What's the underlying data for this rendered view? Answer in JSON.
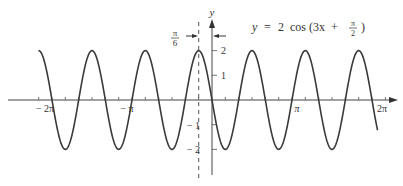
{
  "chart_data": {
    "type": "line",
    "equation": {
      "lhs": "y",
      "eq": "=",
      "rhs_prefix": "2  cos (3x  +",
      "frac_num": "π",
      "frac_den": "2",
      "rhs_suffix": ")"
    },
    "xlabel": "",
    "ylabel": "y",
    "x_tick_labels": [
      "− 2π",
      "− π",
      "π",
      "2π"
    ],
    "x_tick_values": [
      -6.2832,
      -3.1416,
      3.1416,
      6.2832
    ],
    "y_tick_labels": [
      "2",
      "1",
      "− 1",
      "− 2"
    ],
    "y_tick_values": [
      2,
      1,
      -1,
      -2
    ],
    "xlim": [
      -2.17,
      2.07
    ],
    "xlim_units": "multiples of π",
    "ylim": [
      -2,
      2
    ],
    "amplitude": 2,
    "period": "2π/3",
    "phase_shift": "−π/6",
    "annotation": {
      "label_num": "π",
      "label_den": "6",
      "description": "dashed vertical line at x = −π/6 marking the phase shift (peak location)"
    },
    "series": [
      {
        "name": "y = 2 cos(3x + π/2)",
        "x": [
          -6.807,
          -6.283,
          -5.76,
          -5.236,
          -4.712,
          -4.189,
          -3.665,
          -3.142,
          -2.618,
          -2.094,
          -1.571,
          -1.047,
          -0.524,
          0,
          0.524,
          1.047,
          1.571,
          2.094,
          2.618,
          3.142,
          3.665,
          4.189,
          4.712,
          5.236,
          5.76,
          6.283,
          6.5
        ],
        "values": [
          2,
          0,
          -2,
          0,
          2,
          0,
          -2,
          0,
          2,
          0,
          -2,
          0,
          2,
          0,
          -2,
          0,
          2,
          0,
          -2,
          0,
          2,
          0,
          -2,
          0,
          2,
          0,
          -1.1
        ]
      }
    ],
    "grid": false,
    "legend": "none"
  }
}
